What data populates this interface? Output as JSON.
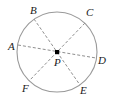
{
  "figure": {
    "kind": "geometry-diagram",
    "background_color": "#ffffff",
    "circle": {
      "name": "circle-outline",
      "center_x": 57,
      "center_y": 52,
      "radius": 40,
      "stroke_color": "#9a9a9a",
      "stroke_width": 1,
      "fill": "none"
    },
    "center_point": {
      "name": "center-point-P",
      "label": "P",
      "x": 57,
      "y": 52,
      "dot_size": 4,
      "dot_color": "#000000",
      "label_x": 54,
      "label_y": 66
    },
    "diameters": [
      {
        "name": "diameter-A-D",
        "from": "A",
        "to": "D",
        "x1": 18,
        "y1": 45,
        "x2": 96,
        "y2": 58,
        "stroke_color": "#8f8f8f",
        "dash": "3 2"
      },
      {
        "name": "diameter-B-E",
        "from": "B",
        "to": "E",
        "x1": 34,
        "y1": 19,
        "x2": 80,
        "y2": 85,
        "stroke_color": "#8f8f8f",
        "dash": "3 2"
      },
      {
        "name": "diameter-C-F",
        "from": "C",
        "to": "F",
        "x1": 85,
        "y1": 23,
        "x2": 29,
        "y2": 81,
        "stroke_color": "#8f8f8f",
        "dash": "3 2"
      }
    ],
    "vertices": [
      {
        "label": "A",
        "name": "vertex-label-A",
        "label_x": 8,
        "label_y": 50,
        "point_x": 18,
        "point_y": 45
      },
      {
        "label": "B",
        "name": "vertex-label-B",
        "label_x": 30,
        "label_y": 14,
        "point_x": 34,
        "point_y": 19
      },
      {
        "label": "C",
        "name": "vertex-label-C",
        "label_x": 86,
        "label_y": 16,
        "point_x": 85,
        "point_y": 23
      },
      {
        "label": "D",
        "name": "vertex-label-D",
        "label_x": 98,
        "label_y": 64,
        "point_x": 96,
        "point_y": 58
      },
      {
        "label": "E",
        "name": "vertex-label-E",
        "label_x": 80,
        "label_y": 94,
        "point_x": 80,
        "point_y": 85
      },
      {
        "label": "F",
        "name": "vertex-label-F",
        "label_x": 22,
        "label_y": 92,
        "point_x": 29,
        "point_y": 81
      }
    ]
  }
}
